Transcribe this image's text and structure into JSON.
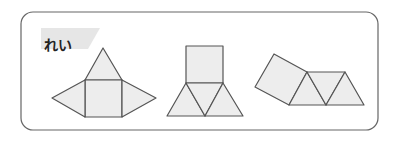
{
  "example_label": "れい",
  "colors": {
    "stroke": "#555555",
    "fill": "#ededed",
    "frame": "#666666",
    "label_bg": "#e3e3e3"
  },
  "figures": [
    {
      "name": "net-square-with-three-triangles",
      "description": "square with triangles on top, left and right"
    },
    {
      "name": "net-square-with-two-triangles-below",
      "description": "square on top, row of three triangles below"
    },
    {
      "name": "net-tilted-square-with-triangle-strip",
      "description": "tilted square attached to a strip of triangles"
    }
  ]
}
